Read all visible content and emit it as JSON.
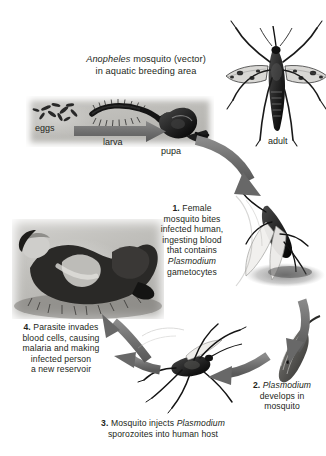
{
  "figure": {
    "domain": "diagram",
    "background_color": "#ffffff",
    "arrow_color": "#6e6e6e",
    "text_color": "#231f20",
    "panel_tone": "grayscale photograph"
  },
  "title": {
    "line1_italic": "Anopheles",
    "line1_rest": " mosquito (vector)",
    "line2": "in aquatic breeding area"
  },
  "stage_labels": {
    "eggs": "eggs",
    "larva": "larva",
    "pupa": "pupa",
    "adult": "adult"
  },
  "steps": [
    {
      "number": "1.",
      "lines": [
        {
          "text": "1. Female",
          "bold_prefix": "1.",
          "italic": false
        },
        {
          "text": "mosquito bites",
          "italic": false
        },
        {
          "text": "infected human,",
          "italic": false
        },
        {
          "text": "ingesting blood",
          "italic": false
        },
        {
          "text": "that contains",
          "italic": false
        },
        {
          "text": "Plasmodium",
          "italic": true
        },
        {
          "text": "gametocytes",
          "italic": false
        }
      ],
      "plain": "1. Female mosquito bites infected human, ingesting blood that contains Plasmodium gametocytes"
    },
    {
      "number": "2.",
      "lines": [
        {
          "text": "2. Plasmodium",
          "bold_prefix": "2.",
          "italic_word": "Plasmodium"
        },
        {
          "text": "develops in",
          "italic": false
        },
        {
          "text": "mosquito",
          "italic": false
        }
      ],
      "plain": "2. Plasmodium develops in mosquito"
    },
    {
      "number": "3.",
      "lines": [
        {
          "text": "3. Mosquito injects Plasmodium",
          "bold_prefix": "3.",
          "italic_word": "Plasmodium"
        },
        {
          "text": "sporozoites into human host",
          "italic": false
        }
      ],
      "plain": "3. Mosquito injects Plasmodium sporozoites into human host"
    },
    {
      "number": "4.",
      "lines": [
        {
          "text": "4. Parasite invades",
          "bold_prefix": "4."
        },
        {
          "text": "blood cells, causing",
          "italic": false
        },
        {
          "text": "malaria and making",
          "italic": false
        },
        {
          "text": "infected person",
          "italic": false
        },
        {
          "text": "a new reservoir",
          "italic": false
        }
      ],
      "plain": "4. Parasite invades blood cells, causing malaria and making infected person a new reservoir"
    }
  ],
  "illustrations": [
    {
      "name": "adult-mosquito-illustration",
      "position": "top-right",
      "description": "Adult Anopheles mosquito, wings spread, spotted wings"
    },
    {
      "name": "aquatic-stages-photo",
      "position": "upper-left",
      "description": "Grayscale photo strip of mosquito eggs, larvae and pupa in water"
    },
    {
      "name": "biting-mosquito-illustration",
      "position": "right-middle",
      "description": "Female mosquito biting, engorged with blood"
    },
    {
      "name": "sleeping-human-photo",
      "position": "left-middle",
      "description": "Grayscale photo of a person reclining / sleeping on the ground"
    },
    {
      "name": "mosquito-gut-illustration",
      "position": "bottom-right",
      "description": "Mosquito midgut showing Plasmodium development"
    },
    {
      "name": "injecting-mosquito-illustration",
      "position": "bottom-center",
      "description": "Mosquito with long legs injecting sporozoites"
    }
  ],
  "cycle_arrows": [
    {
      "name": "arrow-larva-to-pupa",
      "direction": "left-to-right",
      "style": "straight tapered"
    },
    {
      "name": "arrow-pupa-to-adult-bite",
      "direction": "clockwise down-right",
      "style": "curved"
    },
    {
      "name": "arrow-bite-to-development",
      "direction": "clockwise down",
      "style": "curved"
    },
    {
      "name": "arrow-development-to-injection",
      "direction": "counter leftward",
      "style": "curved"
    },
    {
      "name": "arrow-injection-to-human",
      "direction": "leftward",
      "style": "curved"
    },
    {
      "name": "arrow-human-to-reservoir",
      "direction": "upward-left",
      "style": "curved"
    }
  ]
}
